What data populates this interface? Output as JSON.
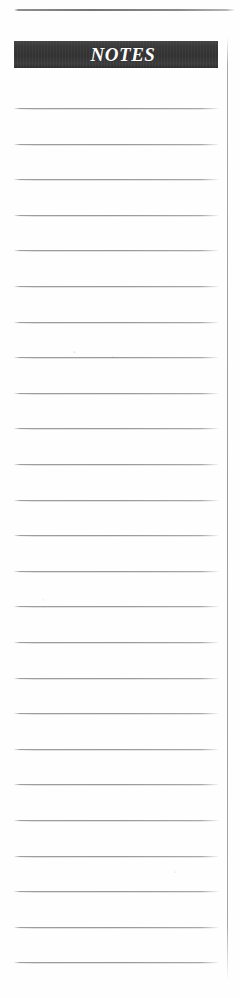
{
  "page": {
    "kind": "notes-page",
    "background_color": "#fefefe"
  },
  "top_rule": {
    "name": "top-horizontal-rule",
    "color": "#7a7a7a"
  },
  "right_rule": {
    "name": "right-vertical-rule",
    "color": "#9e9e9e"
  },
  "header": {
    "title": "NOTES",
    "bar_color": "#3a3a3a",
    "text_color": "#ffffff"
  },
  "notes_area": {
    "line_color": "#9e9e9e",
    "line_count": 25,
    "lines": [
      {
        "index": 1,
        "value": ""
      },
      {
        "index": 2,
        "value": ""
      },
      {
        "index": 3,
        "value": ""
      },
      {
        "index": 4,
        "value": ""
      },
      {
        "index": 5,
        "value": ""
      },
      {
        "index": 6,
        "value": ""
      },
      {
        "index": 7,
        "value": ""
      },
      {
        "index": 8,
        "value": ""
      },
      {
        "index": 9,
        "value": ""
      },
      {
        "index": 10,
        "value": ""
      },
      {
        "index": 11,
        "value": ""
      },
      {
        "index": 12,
        "value": ""
      },
      {
        "index": 13,
        "value": ""
      },
      {
        "index": 14,
        "value": ""
      },
      {
        "index": 15,
        "value": ""
      },
      {
        "index": 16,
        "value": ""
      },
      {
        "index": 17,
        "value": ""
      },
      {
        "index": 18,
        "value": ""
      },
      {
        "index": 19,
        "value": ""
      },
      {
        "index": 20,
        "value": ""
      },
      {
        "index": 21,
        "value": ""
      },
      {
        "index": 22,
        "value": ""
      },
      {
        "index": 23,
        "value": ""
      },
      {
        "index": 24,
        "value": ""
      },
      {
        "index": 25,
        "value": ""
      }
    ]
  }
}
